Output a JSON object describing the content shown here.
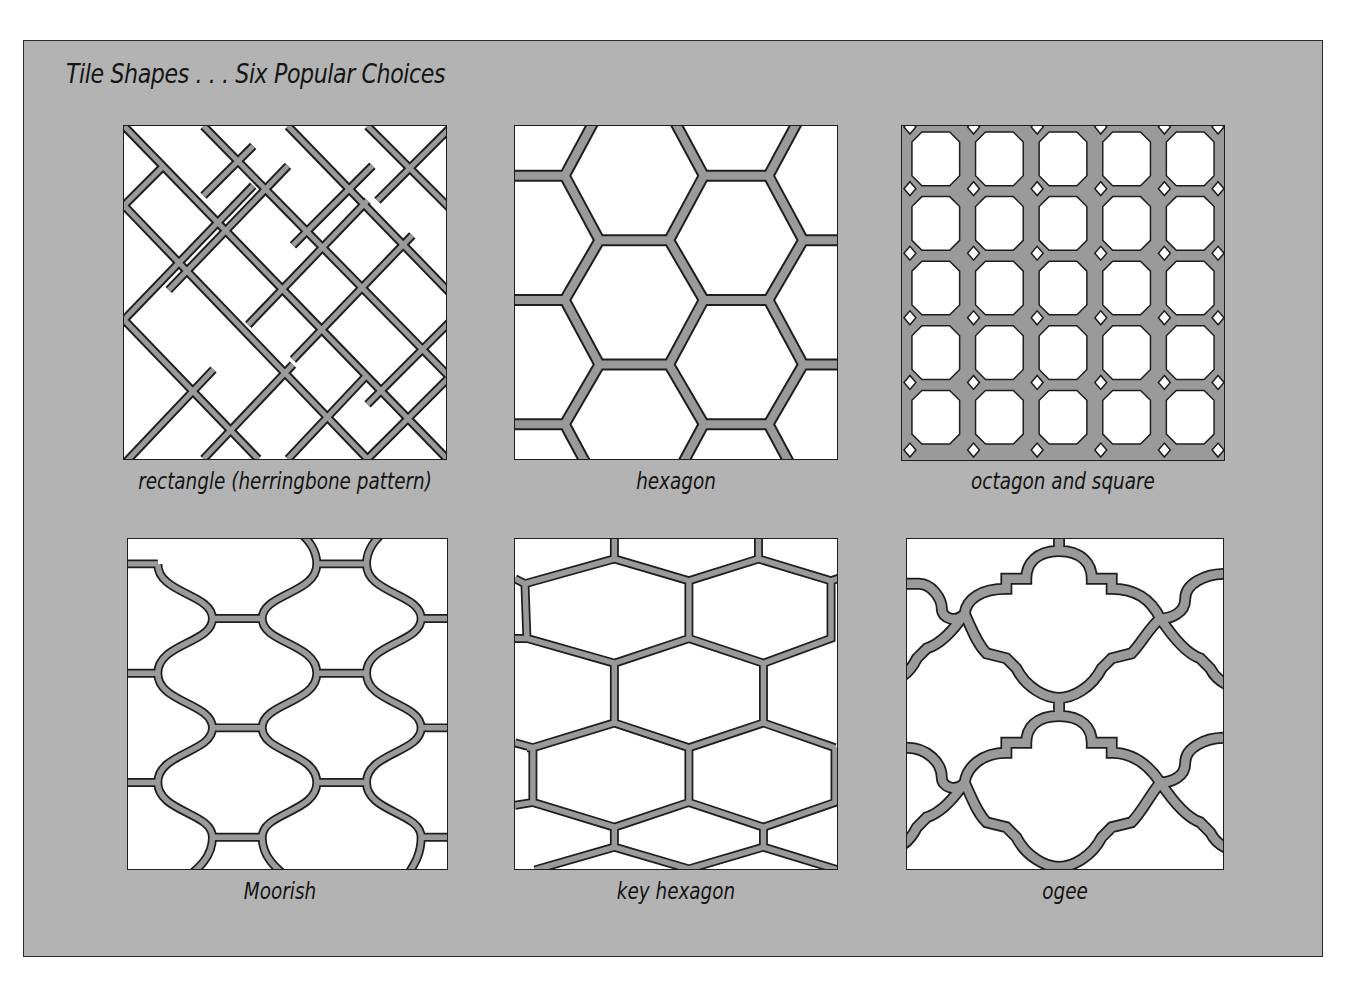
{
  "figure": {
    "title": "Tile Shapes . . . Six Popular Choices",
    "colors": {
      "background": "#b3b3b3",
      "tile_face": "#ffffff",
      "grout": "#8f8f8f",
      "ink": "#1e1e1e"
    },
    "tiles": [
      {
        "id": "rectangle",
        "caption": "rectangle (herringbone pattern)",
        "pattern": "herringbone"
      },
      {
        "id": "hexagon",
        "caption": "hexagon",
        "pattern": "hexagon"
      },
      {
        "id": "octagon-square",
        "caption": "octagon and square",
        "pattern": "octagon-square"
      },
      {
        "id": "moorish",
        "caption": "Moorish",
        "pattern": "moorish"
      },
      {
        "id": "key-hexagon",
        "caption": "key hexagon",
        "pattern": "key-hexagon"
      },
      {
        "id": "ogee",
        "caption": "ogee",
        "pattern": "ogee"
      }
    ]
  }
}
